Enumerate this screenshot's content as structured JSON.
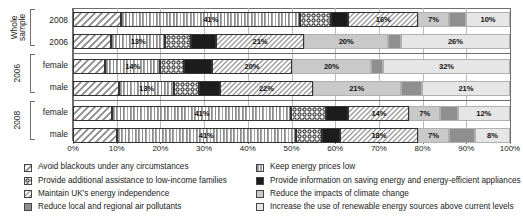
{
  "chart_data": {
    "type": "bar",
    "orientation": "horizontal",
    "stacked": true,
    "stack_mode": "percent",
    "title": "",
    "xlabel": "",
    "ylabel": "",
    "xlim": [
      0,
      100
    ],
    "grid": true,
    "legend_position": "bottom",
    "xticks": [
      "0%",
      "10%",
      "20%",
      "30%",
      "40%",
      "50%",
      "60%",
      "70%",
      "80%",
      "90%",
      "100%"
    ],
    "xtick_values": [
      0,
      10,
      20,
      30,
      40,
      50,
      60,
      70,
      80,
      90,
      100
    ],
    "series": [
      {
        "name": "Avoid blackouts under any circumstances",
        "key": "blackouts",
        "pattern": "diagonal-hatch-light",
        "values": [
          11,
          9,
          8,
          11,
          9,
          10
        ]
      },
      {
        "name": "Keep energy prices low",
        "key": "prices",
        "pattern": "vertical-lines",
        "values": [
          41,
          13,
          14,
          13,
          41,
          41
        ]
      },
      {
        "name": "Provide additional assistance to low-income families",
        "key": "low-income",
        "pattern": "dotted-checker",
        "values": [
          7,
          6,
          6,
          6,
          8,
          6
        ]
      },
      {
        "name": "Provide information on saving energy and energy-efficient appliances",
        "key": "information",
        "pattern": "solid-black",
        "values": [
          4,
          6,
          7,
          5,
          5,
          4
        ]
      },
      {
        "name": "Maintain UK's energy independence",
        "key": "independence",
        "pattern": "diagonal-hatch-dense",
        "values": [
          16,
          21,
          20,
          22,
          14,
          18
        ]
      },
      {
        "name": "Reduce the impacts of climate change",
        "key": "climate",
        "pattern": "light-grey",
        "values": [
          7,
          20,
          20,
          21,
          7,
          7
        ]
      },
      {
        "name": "Reduce local and regional air pollutants",
        "key": "pollutants",
        "pattern": "mid-grey",
        "values": [
          4,
          3,
          3,
          5,
          4,
          6
        ]
      },
      {
        "name": "Increase the use of renewable energy sources above current levels",
        "key": "renewables",
        "pattern": "very-light-grey",
        "values": [
          10,
          26,
          32,
          21,
          12,
          8
        ]
      }
    ],
    "groups": [
      {
        "group_label": "Whole sample",
        "group_label_lines": [
          "Whole",
          "sample"
        ],
        "rows": [
          {
            "label": "2008",
            "values": [
              11,
              41,
              7,
              4,
              16,
              7,
              4,
              10
            ],
            "shown_labels": [
              "",
              "41%",
              "",
              "",
              "16%",
              "7%",
              "",
              "10%"
            ]
          },
          {
            "label": "2006",
            "values": [
              9,
              13,
              6,
              6,
              21,
              20,
              3,
              26
            ],
            "shown_labels": [
              "",
              "13%",
              "",
              "",
              "21%",
              "20%",
              "",
              "26%"
            ]
          }
        ]
      },
      {
        "group_label": "2006",
        "group_label_lines": [
          "2006"
        ],
        "rows": [
          {
            "label": "female",
            "values": [
              8,
              14,
              6,
              7,
              20,
              20,
              3,
              32
            ],
            "shown_labels": [
              "",
              "14%",
              "",
              "",
              "20%",
              "20%",
              "",
              "32%"
            ]
          },
          {
            "label": "male",
            "values": [
              11,
              13,
              6,
              5,
              22,
              21,
              5,
              21
            ],
            "shown_labels": [
              "",
              "13%",
              "",
              "",
              "22%",
              "21%",
              "",
              "21%"
            ]
          }
        ]
      },
      {
        "group_label": "2008",
        "group_label_lines": [
          "2008"
        ],
        "rows": [
          {
            "label": "female",
            "values": [
              9,
              41,
              8,
              5,
              14,
              7,
              4,
              12
            ],
            "shown_labels": [
              "",
              "41%",
              "",
              "",
              "14%",
              "7%",
              "",
              "12%"
            ]
          },
          {
            "label": "male",
            "values": [
              10,
              41,
              6,
              4,
              18,
              7,
              6,
              8
            ],
            "shown_labels": [
              "",
              "41%",
              "",
              "",
              "18%",
              "7%",
              "",
              "8%"
            ]
          }
        ]
      }
    ],
    "legend": {
      "column1": [
        "Avoid blackouts under any circumstances",
        "Provide additional assistance to low-income families",
        "Maintain UK's energy independence",
        "Reduce local and regional air pollutants"
      ],
      "column2": [
        "Keep energy prices low",
        "Provide information on saving energy and energy-efficient appliances",
        "Reduce the impacts of climate change",
        "Increase the use of renewable energy sources above current levels"
      ],
      "column1_patterns": [
        "diagonal-hatch-light",
        "dotted-checker",
        "diagonal-hatch-dense",
        "mid-grey"
      ],
      "column2_patterns": [
        "vertical-lines",
        "solid-black",
        "light-grey",
        "very-light-grey"
      ]
    },
    "colors": {
      "solid_black": "#1c1c1c",
      "mid_grey": "#8f8f8f",
      "light_grey": "#c9c9c9",
      "very_light_grey": "#e6e6e6",
      "gridline": "#b9b9b9",
      "frame": "#6e6e6e",
      "text": "#1a1a1a"
    }
  }
}
